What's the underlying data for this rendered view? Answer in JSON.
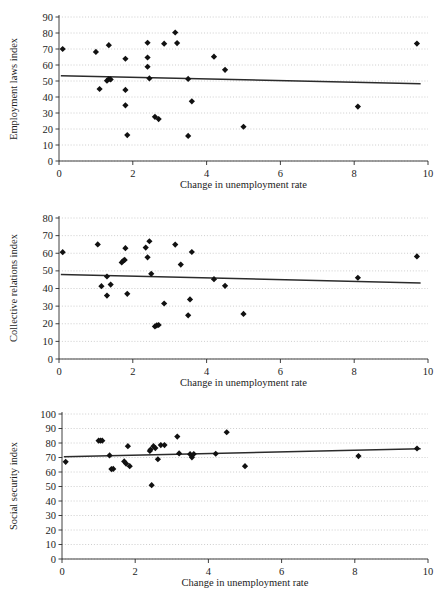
{
  "figure": {
    "background_color": "#ffffff",
    "marker_color": "#111111",
    "trendline_color": "#2b2b2b",
    "gridline_color": "#b9b9b9",
    "axis_color": "#2a2a2a"
  },
  "panels": [
    {
      "id": "employment-laws",
      "ylabel": "Employment laws index",
      "xlabel": "Change in unemployment rate"
    },
    {
      "id": "collective-relations",
      "ylabel": "Collective relations index",
      "xlabel": "Change in unemployment rate"
    },
    {
      "id": "social-security",
      "ylabel": "Social security index",
      "xlabel": "Change in unemployment rate"
    }
  ],
  "chart_data": [
    {
      "type": "scatter",
      "title": "",
      "xlabel": "Change in unemployment rate",
      "ylabel": "Employment laws index",
      "xlim": [
        0,
        10
      ],
      "ylim": [
        0,
        90
      ],
      "xticks": [
        0,
        2,
        4,
        6,
        8,
        10
      ],
      "yticks": [
        0,
        10,
        20,
        30,
        40,
        50,
        60,
        70,
        80,
        90
      ],
      "xtick_labels": [
        "0",
        "2",
        "4",
        "6",
        "8",
        "10"
      ],
      "ytick_labels": [
        "0",
        "10",
        "20",
        "30",
        "40",
        "50",
        "60",
        "70",
        "80",
        "90"
      ],
      "grid": true,
      "legend": null,
      "points": [
        [
          0.1,
          70.0
        ],
        [
          1.0,
          68.2
        ],
        [
          1.1,
          45.0
        ],
        [
          1.3,
          50.2
        ],
        [
          1.35,
          51.2
        ],
        [
          1.35,
          72.4
        ],
        [
          1.4,
          51.0
        ],
        [
          1.8,
          63.9
        ],
        [
          1.8,
          44.4
        ],
        [
          1.8,
          34.8
        ],
        [
          1.85,
          16.2
        ],
        [
          2.4,
          73.9
        ],
        [
          2.4,
          64.7
        ],
        [
          2.4,
          58.9
        ],
        [
          2.45,
          51.6
        ],
        [
          2.6,
          27.6
        ],
        [
          2.7,
          26.2
        ],
        [
          2.85,
          73.3
        ],
        [
          3.15,
          80.3
        ],
        [
          3.2,
          73.7
        ],
        [
          3.5,
          51.3
        ],
        [
          3.5,
          15.7
        ],
        [
          3.6,
          37.3
        ],
        [
          4.2,
          65.2
        ],
        [
          4.5,
          57.0
        ],
        [
          5.0,
          21.4
        ],
        [
          8.1,
          34.0
        ],
        [
          9.7,
          73.4
        ]
      ],
      "trend": {
        "x": [
          0.05,
          9.8
        ],
        "y": [
          53.3,
          48.3
        ]
      }
    },
    {
      "type": "scatter",
      "title": "",
      "xlabel": "Change in unemployment rate",
      "ylabel": "Collective relations index",
      "xlim": [
        0,
        10
      ],
      "ylim": [
        0,
        80
      ],
      "xticks": [
        0,
        2,
        4,
        6,
        8,
        10
      ],
      "yticks": [
        0,
        10,
        20,
        30,
        40,
        50,
        60,
        70,
        80
      ],
      "xtick_labels": [
        "0",
        "2",
        "4",
        "6",
        "8",
        "10"
      ],
      "ytick_labels": [
        "0",
        "10",
        "20",
        "30",
        "40",
        "50",
        "60",
        "70",
        "80"
      ],
      "grid": true,
      "legend": null,
      "points": [
        [
          0.1,
          60.6
        ],
        [
          1.05,
          65.0
        ],
        [
          1.15,
          41.3
        ],
        [
          1.3,
          46.8
        ],
        [
          1.3,
          36.0
        ],
        [
          1.4,
          42.2
        ],
        [
          1.7,
          54.8
        ],
        [
          1.75,
          55.9
        ],
        [
          1.78,
          56.2
        ],
        [
          1.8,
          62.9
        ],
        [
          1.85,
          37.0
        ],
        [
          2.35,
          63.2
        ],
        [
          2.4,
          57.7
        ],
        [
          2.45,
          66.8
        ],
        [
          2.5,
          48.3
        ],
        [
          2.6,
          18.5
        ],
        [
          2.65,
          19.1
        ],
        [
          2.7,
          19.3
        ],
        [
          2.85,
          31.5
        ],
        [
          3.15,
          64.9
        ],
        [
          3.3,
          53.6
        ],
        [
          3.5,
          24.8
        ],
        [
          3.55,
          33.8
        ],
        [
          3.6,
          60.7
        ],
        [
          4.2,
          45.3
        ],
        [
          4.5,
          41.5
        ],
        [
          5.0,
          25.6
        ],
        [
          8.1,
          46.1
        ],
        [
          9.7,
          58.2
        ]
      ],
      "trend": {
        "x": [
          0.05,
          9.8
        ],
        "y": [
          48.0,
          43.1
        ]
      }
    },
    {
      "type": "scatter",
      "title": "",
      "xlabel": "Change in unemployment rate",
      "ylabel": "Social security index",
      "xlim": [
        0,
        10
      ],
      "ylim": [
        0,
        100
      ],
      "xticks": [
        0,
        2,
        4,
        6,
        8,
        10
      ],
      "yticks": [
        0,
        10,
        20,
        30,
        40,
        50,
        60,
        70,
        80,
        90,
        100
      ],
      "xtick_labels": [
        "0",
        "2",
        "4",
        "6",
        "8",
        "10"
      ],
      "ytick_labels": [
        "0",
        "10",
        "20",
        "30",
        "40",
        "50",
        "60",
        "70",
        "80",
        "90",
        "100"
      ],
      "grid": true,
      "legend": null,
      "points": [
        [
          0.1,
          67.0
        ],
        [
          1.0,
          81.6
        ],
        [
          1.05,
          81.7
        ],
        [
          1.1,
          81.6
        ],
        [
          1.3,
          71.4
        ],
        [
          1.35,
          62.0
        ],
        [
          1.4,
          62.1
        ],
        [
          1.7,
          67.3
        ],
        [
          1.75,
          65.8
        ],
        [
          1.8,
          77.8
        ],
        [
          1.85,
          64.0
        ],
        [
          2.4,
          74.5
        ],
        [
          2.42,
          75.5
        ],
        [
          2.45,
          50.9
        ],
        [
          2.5,
          77.8
        ],
        [
          2.55,
          76.5
        ],
        [
          2.7,
          78.6
        ],
        [
          2.8,
          78.6
        ],
        [
          2.62,
          68.8
        ],
        [
          3.15,
          84.4
        ],
        [
          3.2,
          72.8
        ],
        [
          3.5,
          72.3
        ],
        [
          3.55,
          70.1
        ],
        [
          3.6,
          72.4
        ],
        [
          4.2,
          72.6
        ],
        [
          4.5,
          87.4
        ],
        [
          5.0,
          64.0
        ],
        [
          8.1,
          71.0
        ],
        [
          9.7,
          76.2
        ]
      ],
      "trend": {
        "x": [
          0.05,
          9.8
        ],
        "y": [
          70.6,
          76.0
        ]
      }
    }
  ]
}
